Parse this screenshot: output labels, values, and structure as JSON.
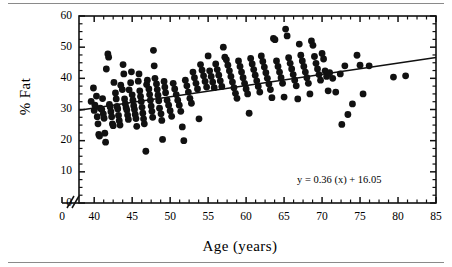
{
  "figure": {
    "type": "scatter-plot-with-regression",
    "background": "#ffffff",
    "ink": "#111111"
  },
  "axes": {
    "xlabel": "Age (years)",
    "ylabel": "% Fat",
    "x_ticks": [
      "0",
      "40",
      "45",
      "50",
      "55",
      "60",
      "65",
      "70",
      "75",
      "80",
      "85"
    ],
    "y_ticks": [
      "0",
      "10",
      "20",
      "30",
      "40",
      "50",
      "60"
    ],
    "x_axis_break": true,
    "x_break_symbol": "//",
    "grid": false
  },
  "annotation": {
    "equation": "y = 0.36 (x) + 16.05"
  },
  "chart_data": {
    "type": "scatter",
    "title": "",
    "xlabel": "Age (years)",
    "ylabel": "% Fat",
    "xlim": [
      38,
      85
    ],
    "ylim": [
      0,
      60
    ],
    "x_tick_values": [
      0,
      40,
      45,
      50,
      55,
      60,
      65,
      70,
      75,
      80,
      85
    ],
    "y_tick_values": [
      0,
      10,
      20,
      30,
      40,
      50,
      60
    ],
    "x_axis_break_after": 0,
    "grid": false,
    "legend": "none",
    "marker": {
      "shape": "circle",
      "color": "#111111",
      "size_px": 5.4
    },
    "regression_line": {
      "equation": "y = 0.36 (x) + 16.05",
      "slope": 0.36,
      "intercept": 16.05,
      "color": "#111111",
      "x_start": 38,
      "x_end": 85,
      "y_start": 29.7,
      "y_end": 46.7
    },
    "annotations": [
      {
        "text": "y = 0.36 (x) + 16.05",
        "x": 75.0,
        "y": 7.0
      }
    ],
    "n_points": 208,
    "points": [
      [
        39.6,
        32.6
      ],
      [
        39.9,
        36.9
      ],
      [
        40.0,
        29.7
      ],
      [
        40.1,
        31.4
      ],
      [
        40.3,
        34.3
      ],
      [
        40.4,
        27.7
      ],
      [
        40.5,
        25.4
      ],
      [
        40.6,
        22.0
      ],
      [
        40.7,
        21.5
      ],
      [
        40.8,
        30.4
      ],
      [
        41.0,
        30.0
      ],
      [
        41.1,
        33.5
      ],
      [
        41.2,
        28.6
      ],
      [
        41.3,
        27.2
      ],
      [
        41.4,
        22.4
      ],
      [
        41.5,
        19.5
      ],
      [
        41.6,
        43.0
      ],
      [
        41.8,
        47.8
      ],
      [
        41.9,
        46.8
      ],
      [
        42.0,
        31.6
      ],
      [
        42.1,
        30.8
      ],
      [
        42.2,
        29.3
      ],
      [
        42.3,
        27.7
      ],
      [
        42.4,
        25.4
      ],
      [
        42.5,
        24.8
      ],
      [
        42.6,
        38.7
      ],
      [
        42.8,
        35.3
      ],
      [
        42.9,
        33.4
      ],
      [
        43.0,
        31.0
      ],
      [
        43.1,
        30.2
      ],
      [
        43.2,
        28.1
      ],
      [
        43.3,
        26.4
      ],
      [
        43.4,
        25.0
      ],
      [
        43.5,
        37.8
      ],
      [
        43.7,
        36.4
      ],
      [
        43.8,
        44.4
      ],
      [
        43.9,
        41.4
      ],
      [
        44.0,
        33.4
      ],
      [
        44.1,
        31.8
      ],
      [
        44.2,
        30.6
      ],
      [
        44.3,
        29.8
      ],
      [
        44.4,
        28.2
      ],
      [
        44.5,
        26.8
      ],
      [
        44.6,
        36.3
      ],
      [
        44.8,
        38.6
      ],
      [
        44.9,
        42.1
      ],
      [
        45.0,
        34.7
      ],
      [
        45.1,
        33.0
      ],
      [
        45.2,
        31.2
      ],
      [
        45.3,
        30.0
      ],
      [
        45.4,
        28.4
      ],
      [
        45.5,
        27.1
      ],
      [
        45.6,
        24.6
      ],
      [
        45.8,
        39.1
      ],
      [
        45.9,
        41.4
      ],
      [
        46.0,
        36.0
      ],
      [
        46.1,
        34.2
      ],
      [
        46.2,
        32.6
      ],
      [
        46.3,
        30.7
      ],
      [
        46.4,
        28.8
      ],
      [
        46.5,
        27.0
      ],
      [
        46.6,
        25.4
      ],
      [
        46.8,
        16.6
      ],
      [
        46.9,
        38.0
      ],
      [
        47.0,
        39.4
      ],
      [
        47.2,
        36.6
      ],
      [
        47.3,
        34.8
      ],
      [
        47.4,
        33.0
      ],
      [
        47.5,
        31.1
      ],
      [
        47.6,
        29.4
      ],
      [
        47.7,
        27.5
      ],
      [
        47.8,
        49.0
      ],
      [
        47.9,
        44.0
      ],
      [
        48.0,
        40.0
      ],
      [
        48.2,
        38.2
      ],
      [
        48.3,
        36.4
      ],
      [
        48.4,
        34.6
      ],
      [
        48.5,
        32.8
      ],
      [
        48.6,
        30.4
      ],
      [
        48.8,
        28.6
      ],
      [
        48.9,
        26.5
      ],
      [
        49.0,
        20.4
      ],
      [
        49.2,
        39.0
      ],
      [
        49.3,
        37.2
      ],
      [
        49.4,
        35.4
      ],
      [
        49.6,
        33.0
      ],
      [
        49.8,
        31.4
      ],
      [
        50.0,
        29.6
      ],
      [
        50.2,
        27.8
      ],
      [
        50.4,
        38.4
      ],
      [
        50.6,
        36.6
      ],
      [
        50.8,
        34.8
      ],
      [
        51.0,
        33.0
      ],
      [
        51.2,
        31.4
      ],
      [
        51.4,
        29.4
      ],
      [
        51.6,
        24.4
      ],
      [
        51.8,
        20.0
      ],
      [
        52.0,
        39.4
      ],
      [
        52.2,
        37.6
      ],
      [
        52.4,
        35.6
      ],
      [
        52.6,
        33.6
      ],
      [
        52.8,
        32.0
      ],
      [
        53.0,
        42.0
      ],
      [
        53.2,
        40.2
      ],
      [
        53.4,
        38.4
      ],
      [
        53.6,
        36.6
      ],
      [
        53.8,
        27.0
      ],
      [
        54.0,
        44.4
      ],
      [
        54.2,
        42.6
      ],
      [
        54.4,
        40.8
      ],
      [
        54.6,
        39.0
      ],
      [
        54.8,
        37.2
      ],
      [
        55.0,
        47.2
      ],
      [
        55.2,
        42.4
      ],
      [
        55.4,
        40.6
      ],
      [
        55.6,
        38.8
      ],
      [
        55.8,
        37.0
      ],
      [
        56.0,
        44.6
      ],
      [
        56.2,
        42.8
      ],
      [
        56.4,
        41.0
      ],
      [
        56.6,
        39.2
      ],
      [
        56.8,
        37.4
      ],
      [
        57.0,
        50.0
      ],
      [
        57.2,
        46.8
      ],
      [
        57.4,
        46.0
      ],
      [
        57.6,
        44.2
      ],
      [
        57.8,
        42.4
      ],
      [
        58.0,
        40.6
      ],
      [
        58.2,
        38.8
      ],
      [
        58.4,
        37.0
      ],
      [
        58.6,
        35.2
      ],
      [
        58.8,
        33.6
      ],
      [
        59.0,
        45.6
      ],
      [
        59.2,
        43.8
      ],
      [
        59.4,
        42.0
      ],
      [
        59.6,
        40.2
      ],
      [
        59.8,
        38.4
      ],
      [
        60.0,
        36.6
      ],
      [
        60.2,
        35.0
      ],
      [
        60.4,
        28.8
      ],
      [
        60.6,
        46.4
      ],
      [
        60.8,
        44.6
      ],
      [
        61.0,
        42.8
      ],
      [
        61.2,
        41.0
      ],
      [
        61.4,
        39.2
      ],
      [
        61.6,
        37.4
      ],
      [
        61.8,
        35.6
      ],
      [
        62.0,
        47.2
      ],
      [
        62.2,
        45.4
      ],
      [
        62.4,
        43.6
      ],
      [
        62.6,
        41.8
      ],
      [
        62.8,
        40.0
      ],
      [
        63.0,
        38.2
      ],
      [
        63.2,
        36.4
      ],
      [
        63.4,
        33.8
      ],
      [
        63.6,
        52.8
      ],
      [
        63.8,
        52.4
      ],
      [
        64.0,
        45.6
      ],
      [
        64.2,
        43.8
      ],
      [
        64.4,
        42.0
      ],
      [
        64.6,
        40.2
      ],
      [
        64.8,
        38.4
      ],
      [
        65.0,
        34.0
      ],
      [
        65.2,
        55.8
      ],
      [
        65.4,
        53.6
      ],
      [
        65.6,
        46.6
      ],
      [
        65.8,
        44.8
      ],
      [
        66.0,
        43.0
      ],
      [
        66.2,
        41.2
      ],
      [
        66.4,
        39.4
      ],
      [
        66.6,
        37.6
      ],
      [
        66.8,
        33.4
      ],
      [
        67.0,
        51.0
      ],
      [
        67.2,
        47.4
      ],
      [
        67.4,
        45.6
      ],
      [
        67.6,
        43.8
      ],
      [
        67.8,
        42.0
      ],
      [
        68.0,
        40.2
      ],
      [
        68.2,
        38.4
      ],
      [
        68.4,
        35.0
      ],
      [
        68.6,
        52.0
      ],
      [
        68.8,
        50.6
      ],
      [
        69.0,
        47.0
      ],
      [
        69.2,
        44.8
      ],
      [
        69.4,
        43.0
      ],
      [
        69.6,
        41.2
      ],
      [
        69.8,
        39.4
      ],
      [
        70.0,
        48.0
      ],
      [
        70.2,
        46.2
      ],
      [
        70.4,
        42.4
      ],
      [
        70.6,
        40.6
      ],
      [
        70.8,
        36.0
      ],
      [
        71.0,
        41.8
      ],
      [
        71.4,
        40.0
      ],
      [
        71.8,
        35.6
      ],
      [
        72.4,
        41.4
      ],
      [
        72.6,
        25.2
      ],
      [
        73.0,
        44.0
      ],
      [
        73.4,
        28.4
      ],
      [
        74.0,
        31.8
      ],
      [
        74.6,
        47.4
      ],
      [
        75.0,
        44.2
      ],
      [
        75.4,
        35.0
      ],
      [
        76.2,
        44.0
      ],
      [
        79.4,
        40.4
      ],
      [
        81.0,
        40.8
      ]
    ]
  }
}
